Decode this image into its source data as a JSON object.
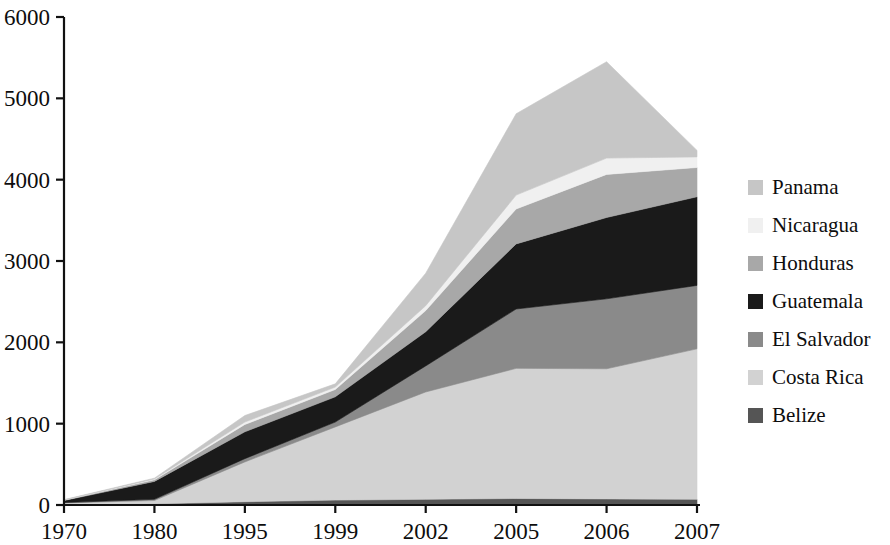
{
  "chart_data": {
    "type": "area",
    "stacked": true,
    "title": "",
    "subtitle": "",
    "xlabel": "",
    "ylabel": "",
    "categories": [
      "1970",
      "1980",
      "1995",
      "1999",
      "2002",
      "2005",
      "2006",
      "2007"
    ],
    "ylim": [
      0,
      6000
    ],
    "yticks": [
      0,
      1000,
      2000,
      3000,
      4000,
      5000,
      6000
    ],
    "ytick_labels": [
      "0",
      "1000",
      "2000",
      "3000",
      "4000",
      "5000",
      "6000"
    ],
    "grid": false,
    "legend_position": "right",
    "stack_order_bottom_to_top": [
      "Belize",
      "Costa Rica",
      "El Salvador",
      "Guatemala",
      "Honduras",
      "Nicaragua",
      "Panama"
    ],
    "series": [
      {
        "name": "Belize",
        "color": "#555555",
        "values": [
          10,
          15,
          40,
          60,
          70,
          80,
          75,
          70
        ]
      },
      {
        "name": "Costa Rica",
        "color": "#d2d2d2",
        "values": [
          15,
          40,
          490,
          900,
          1320,
          1600,
          1600,
          1850
        ]
      },
      {
        "name": "El Salvador",
        "color": "#8a8a8a",
        "values": [
          5,
          15,
          40,
          60,
          320,
          730,
          860,
          780
        ]
      },
      {
        "name": "Guatemala",
        "color": "#1a1a1a",
        "values": [
          25,
          220,
          330,
          310,
          420,
          800,
          1000,
          1090
        ]
      },
      {
        "name": "Honduras",
        "color": "#a8a8a8",
        "values": [
          5,
          20,
          90,
          90,
          260,
          430,
          530,
          360
        ]
      },
      {
        "name": "Nicaragua",
        "color": "#f0f0f0",
        "values": [
          3,
          10,
          30,
          30,
          60,
          170,
          200,
          130
        ]
      },
      {
        "name": "Panama",
        "color": "#c6c6c6",
        "values": [
          2,
          10,
          80,
          40,
          400,
          1000,
          1185,
          80
        ]
      }
    ],
    "totals": [
      65,
      330,
      1100,
      1490,
      2850,
      4810,
      5450,
      4360
    ]
  },
  "legend": {
    "items": [
      {
        "label": "Panama",
        "color": "#c6c6c6"
      },
      {
        "label": "Nicaragua",
        "color": "#f0f0f0"
      },
      {
        "label": "Honduras",
        "color": "#a8a8a8"
      },
      {
        "label": "Guatemala",
        "color": "#1a1a1a"
      },
      {
        "label": "El Salvador",
        "color": "#8a8a8a"
      },
      {
        "label": "Costa Rica",
        "color": "#d2d2d2"
      },
      {
        "label": "Belize",
        "color": "#555555"
      }
    ]
  },
  "axes": {
    "axis_color": "#111111"
  }
}
